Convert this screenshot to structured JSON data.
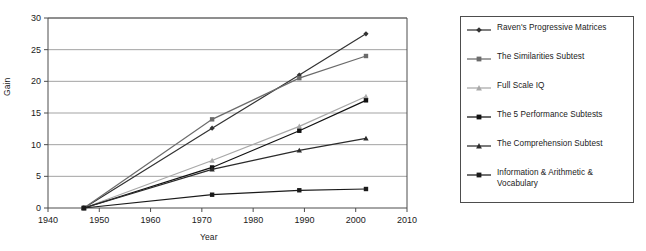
{
  "chart_data": {
    "type": "line",
    "title": "",
    "xlabel": "Year",
    "ylabel": "Gain",
    "x": [
      1947,
      1972,
      1989,
      2002
    ],
    "xlim": [
      1940,
      2010
    ],
    "ylim": [
      0,
      30
    ],
    "xticks": [
      1940,
      1950,
      1960,
      1970,
      1980,
      1990,
      2000,
      2010
    ],
    "yticks": [
      0,
      5,
      10,
      15,
      20,
      25,
      30
    ],
    "xtick_labels": [
      "1940",
      "1950",
      "1960",
      "1970",
      "1980",
      "1990",
      "2000",
      "2010"
    ],
    "ytick_labels": [
      "0",
      "5",
      "10",
      "15",
      "20",
      "25",
      "30"
    ],
    "grid": "horizontal",
    "legend_position": "right",
    "series": [
      {
        "name": "Raven's Progressive Matrices",
        "values": [
          0,
          12.6,
          21.0,
          27.5
        ],
        "color": "#333333",
        "marker": "diamond"
      },
      {
        "name": "The Similarities Subtest",
        "values": [
          0,
          14.0,
          20.5,
          24.0
        ],
        "color": "#6b6b6b",
        "marker": "square"
      },
      {
        "name": "Full Scale IQ",
        "values": [
          0,
          7.5,
          12.9,
          17.6
        ],
        "color": "#a8a8a8",
        "marker": "triangle"
      },
      {
        "name": "The 5 Performance Subtests",
        "values": [
          0,
          6.4,
          12.2,
          17.0
        ],
        "color": "#111111",
        "marker": "square"
      },
      {
        "name": "The Comprehension Subtest",
        "values": [
          0,
          6.1,
          9.1,
          11.0
        ],
        "color": "#2b2b2b",
        "marker": "triangle"
      },
      {
        "name": "Information & Arithmetic & Vocabulary",
        "values": [
          0,
          2.1,
          2.8,
          3.0
        ],
        "color": "#1a1a1a",
        "marker": "square"
      }
    ]
  },
  "legend": {
    "entries": [
      {
        "label": "Raven's Progressive Matrices"
      },
      {
        "label": "The Similarities Subtest"
      },
      {
        "label": "Full Scale IQ"
      },
      {
        "label": "The 5 Performance Subtests"
      },
      {
        "label": "The Comprehension Subtest"
      },
      {
        "label": "Information & Arithmetic & Vocabulary"
      }
    ]
  },
  "axes": {
    "x_title": "Year",
    "y_title": "Gain"
  },
  "colors": {
    "axis": "#4d4d4d",
    "grid": "#999999",
    "text": "#1a1a1a",
    "background": "#ffffff"
  }
}
